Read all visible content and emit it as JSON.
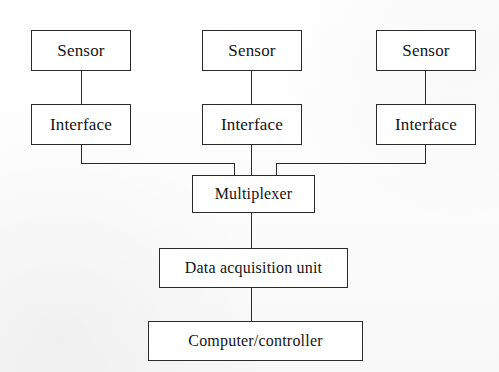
{
  "diagram": {
    "type": "block-diagram",
    "background_color": "#ffffff",
    "line_color": "#2b2b2b",
    "text_color": "#141414",
    "nodes": [
      {
        "id": "sensor-1",
        "label": "Sensor",
        "column": "left",
        "row": "sensor"
      },
      {
        "id": "sensor-2",
        "label": "Sensor",
        "column": "center",
        "row": "sensor"
      },
      {
        "id": "sensor-3",
        "label": "Sensor",
        "column": "right",
        "row": "sensor"
      },
      {
        "id": "interface-1",
        "label": "Interface",
        "column": "left",
        "row": "interface"
      },
      {
        "id": "interface-2",
        "label": "Interface",
        "column": "center",
        "row": "interface"
      },
      {
        "id": "interface-3",
        "label": "Interface",
        "column": "right",
        "row": "interface"
      },
      {
        "id": "multiplexer",
        "label": "Multiplexer",
        "column": "center",
        "row": "multiplexer"
      },
      {
        "id": "daq",
        "label": "Data acquisition unit",
        "column": "center",
        "row": "daq"
      },
      {
        "id": "computer",
        "label": "Computer/controller",
        "column": "center",
        "row": "computer"
      }
    ],
    "connections": [
      {
        "from": "sensor-1",
        "to": "interface-1",
        "style": "straight"
      },
      {
        "from": "sensor-2",
        "to": "interface-2",
        "style": "straight"
      },
      {
        "from": "sensor-3",
        "to": "interface-3",
        "style": "straight"
      },
      {
        "from": "interface-1",
        "to": "multiplexer",
        "style": "orthogonal"
      },
      {
        "from": "interface-2",
        "to": "multiplexer",
        "style": "straight"
      },
      {
        "from": "interface-3",
        "to": "multiplexer",
        "style": "orthogonal"
      },
      {
        "from": "multiplexer",
        "to": "daq",
        "style": "straight"
      },
      {
        "from": "daq",
        "to": "computer",
        "style": "straight"
      }
    ]
  }
}
